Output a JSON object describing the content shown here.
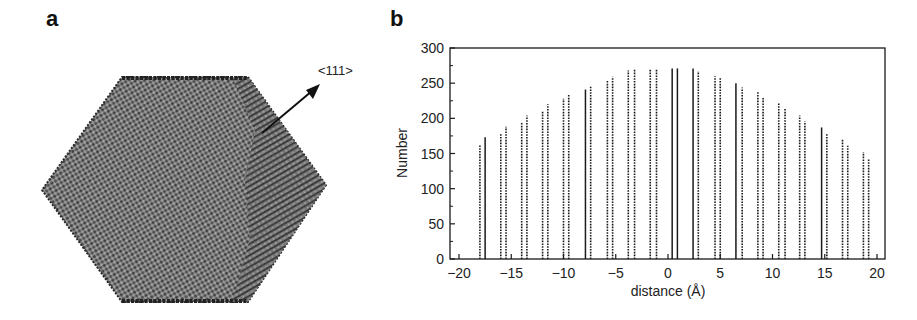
{
  "panels": {
    "a": {
      "label": "a",
      "annotation": "<111>",
      "description": "atomistic model of truncated octahedral nanoparticle viewed along axis; arrow marks <111> direction"
    },
    "b": {
      "label": "b"
    }
  },
  "chart_data": {
    "type": "bar",
    "title": "",
    "xlabel": "distance (Å)",
    "ylabel": "Number",
    "xlim": [
      -21,
      21
    ],
    "ylim": [
      0,
      300
    ],
    "xticks": [
      -20,
      -15,
      -10,
      -5,
      0,
      5,
      10,
      15,
      20
    ],
    "yticks": [
      0,
      50,
      100,
      150,
      200,
      250,
      300
    ],
    "grid": false,
    "legend": null,
    "bars": [
      {
        "x": -18.0,
        "y": 162,
        "style": "dotted"
      },
      {
        "x": -17.5,
        "y": 173,
        "style": "solid"
      },
      {
        "x": -16.0,
        "y": 178,
        "style": "dotted"
      },
      {
        "x": -15.5,
        "y": 188,
        "style": "dotted"
      },
      {
        "x": -14.0,
        "y": 195,
        "style": "dotted"
      },
      {
        "x": -13.5,
        "y": 204,
        "style": "dotted"
      },
      {
        "x": -12.0,
        "y": 211,
        "style": "dotted"
      },
      {
        "x": -11.5,
        "y": 220,
        "style": "dotted"
      },
      {
        "x": -10.0,
        "y": 228,
        "style": "dotted"
      },
      {
        "x": -9.5,
        "y": 233,
        "style": "dotted"
      },
      {
        "x": -7.9,
        "y": 241,
        "style": "solid"
      },
      {
        "x": -7.4,
        "y": 245,
        "style": "dotted"
      },
      {
        "x": -5.8,
        "y": 254,
        "style": "dotted"
      },
      {
        "x": -5.3,
        "y": 259,
        "style": "dotted"
      },
      {
        "x": -3.8,
        "y": 268,
        "style": "dotted"
      },
      {
        "x": -3.2,
        "y": 270,
        "style": "dotted"
      },
      {
        "x": -1.7,
        "y": 271,
        "style": "dotted"
      },
      {
        "x": -1.1,
        "y": 271,
        "style": "dotted"
      },
      {
        "x": 0.4,
        "y": 271,
        "style": "solid"
      },
      {
        "x": 0.9,
        "y": 271,
        "style": "solid"
      },
      {
        "x": 2.4,
        "y": 271,
        "style": "solid"
      },
      {
        "x": 2.9,
        "y": 267,
        "style": "dotted"
      },
      {
        "x": 4.5,
        "y": 260,
        "style": "dotted"
      },
      {
        "x": 5.0,
        "y": 257,
        "style": "dotted"
      },
      {
        "x": 6.5,
        "y": 250,
        "style": "solid"
      },
      {
        "x": 7.1,
        "y": 244,
        "style": "dotted"
      },
      {
        "x": 8.6,
        "y": 237,
        "style": "dotted"
      },
      {
        "x": 9.1,
        "y": 229,
        "style": "dotted"
      },
      {
        "x": 10.6,
        "y": 221,
        "style": "dotted"
      },
      {
        "x": 11.2,
        "y": 215,
        "style": "dotted"
      },
      {
        "x": 12.6,
        "y": 204,
        "style": "dotted"
      },
      {
        "x": 13.1,
        "y": 196,
        "style": "dotted"
      },
      {
        "x": 14.7,
        "y": 187,
        "style": "solid"
      },
      {
        "x": 15.2,
        "y": 178,
        "style": "dotted"
      },
      {
        "x": 16.7,
        "y": 171,
        "style": "dotted"
      },
      {
        "x": 17.2,
        "y": 161,
        "style": "dotted"
      },
      {
        "x": 18.7,
        "y": 152,
        "style": "dotted"
      },
      {
        "x": 19.2,
        "y": 143,
        "style": "dotted"
      }
    ],
    "x": [
      -18.0,
      -17.5,
      -16.0,
      -15.5,
      -14.0,
      -13.5,
      -12.0,
      -11.5,
      -10.0,
      -9.5,
      -7.9,
      -7.4,
      -5.8,
      -5.3,
      -3.8,
      -3.2,
      -1.7,
      -1.1,
      0.4,
      0.9,
      2.4,
      2.9,
      4.5,
      5.0,
      6.5,
      7.1,
      8.6,
      9.1,
      10.6,
      11.2,
      12.6,
      13.1,
      14.7,
      15.2,
      16.7,
      17.2,
      18.7,
      19.2
    ],
    "values": [
      162,
      173,
      178,
      188,
      195,
      204,
      211,
      220,
      228,
      233,
      241,
      245,
      254,
      259,
      268,
      270,
      271,
      271,
      271,
      271,
      271,
      267,
      260,
      257,
      250,
      244,
      237,
      229,
      221,
      215,
      204,
      196,
      187,
      178,
      171,
      161,
      152,
      143
    ]
  },
  "colors": {
    "ink": "#1a1a1a",
    "particle_dark": "#3a3a3a",
    "particle_mid": "#707070",
    "particle_light": "#a8a8a8"
  }
}
